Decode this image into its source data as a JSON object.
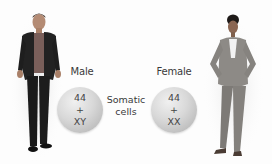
{
  "diagram": {
    "male": {
      "label": "Male",
      "autosomes": "44",
      "plus": "+",
      "sex_chromosomes": "XY"
    },
    "female": {
      "label": "Female",
      "autosomes": "44",
      "plus": "+",
      "sex_chromosomes": "XX"
    },
    "center_label": {
      "line1": "Somatic",
      "line2": "cells"
    },
    "colors": {
      "cell_fill": "#d4d4d4",
      "text": "#3a3a3a",
      "background": "#ffffff"
    }
  }
}
